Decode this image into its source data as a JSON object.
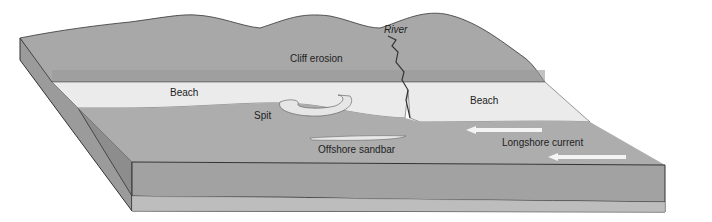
{
  "diagram": {
    "labels": {
      "river": "River",
      "cliff_erosion": "Cliff erosion",
      "beach_left": "Beach",
      "beach_right": "Beach",
      "spit": "Spit",
      "offshore_sandbar": "Offshore sandbar",
      "longshore_current": "Longshore current"
    },
    "colors": {
      "hills": "#a8a8a8",
      "beach": "#ebebeb",
      "water": "#a9a9a9",
      "block_side": "#9e9e9e",
      "block_base": "#c4c4c4",
      "arrow": "#f4f4f4",
      "outline": "#333333"
    }
  }
}
